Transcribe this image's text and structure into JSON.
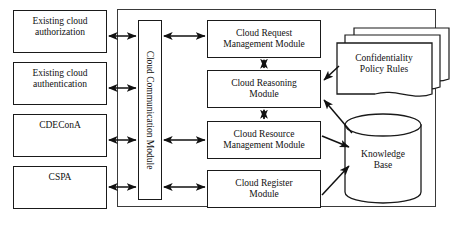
{
  "diagram": {
    "stroke_color": "#1a1a1a",
    "container_stroke_color": "#3a3a3a",
    "background_color": "#ffffff"
  },
  "actors": [
    {
      "id": "existing-cloud-authorization",
      "label": "Existing cloud\nauthorization"
    },
    {
      "id": "existing-cloud-authentication",
      "label": "Existing cloud\nauthentication"
    },
    {
      "id": "cdecona",
      "label": "CDEConA"
    },
    {
      "id": "cspa",
      "label": "CSPA"
    }
  ],
  "communication": {
    "id": "cloud-communication-module",
    "label": "Cloud Communication Module"
  },
  "modules": [
    {
      "id": "cloud-request-management-module",
      "label": "Cloud Request\nManagement Module"
    },
    {
      "id": "cloud-reasoning-module",
      "label": "Cloud Reasoning\nModule"
    },
    {
      "id": "cloud-resource-management-module",
      "label": "Cloud Resource\nManagement Module"
    },
    {
      "id": "cloud-register-module",
      "label": "Cloud Register\nModule"
    }
  ],
  "stores": [
    {
      "id": "confidentiality-policy-rules",
      "label": "Confidentiality\nPolicy Rules",
      "shape": "stacked-document"
    },
    {
      "id": "knowledge-base",
      "label": "Knowledge\nBase",
      "shape": "cylinder"
    }
  ],
  "connections": [
    {
      "from": "existing-cloud-authorization",
      "to": "cloud-communication-module",
      "direction": "both"
    },
    {
      "from": "existing-cloud-authentication",
      "to": "cloud-communication-module",
      "direction": "both"
    },
    {
      "from": "cdecona",
      "to": "cloud-communication-module",
      "direction": "both"
    },
    {
      "from": "cspa",
      "to": "cloud-communication-module",
      "direction": "both"
    },
    {
      "from": "cloud-communication-module",
      "to": "cloud-request-management-module",
      "direction": "both"
    },
    {
      "from": "cloud-communication-module",
      "to": "cloud-resource-management-module",
      "direction": "both"
    },
    {
      "from": "cloud-communication-module",
      "to": "cloud-register-module",
      "direction": "both"
    },
    {
      "from": "cloud-request-management-module",
      "to": "cloud-reasoning-module",
      "direction": "both"
    },
    {
      "from": "cloud-reasoning-module",
      "to": "cloud-resource-management-module",
      "direction": "both"
    },
    {
      "from": "confidentiality-policy-rules",
      "to": "cloud-reasoning-module",
      "direction": "to"
    },
    {
      "from": "knowledge-base",
      "to": "cloud-reasoning-module",
      "direction": "to"
    },
    {
      "from": "cloud-resource-management-module",
      "to": "knowledge-base",
      "direction": "to"
    },
    {
      "from": "cloud-register-module",
      "to": "knowledge-base",
      "direction": "to"
    }
  ]
}
